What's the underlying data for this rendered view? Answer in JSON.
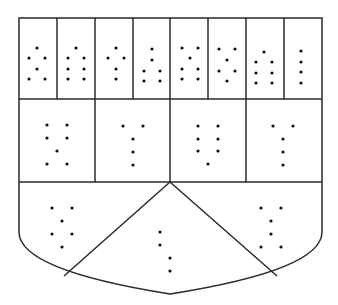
{
  "diagram": {
    "type": "heraldic-shield-braille-cells",
    "colors": {
      "line": "#2a2a2a",
      "dot": "#111111",
      "background": "#ffffff"
    },
    "shield": {
      "left": 19,
      "top": 18,
      "right": 322,
      "row1_bottom": 99,
      "row2_bottom": 182,
      "side_bottom": 232,
      "apex_x": 170,
      "apex_y": 294
    },
    "row1_dividers": [
      57,
      95,
      133,
      170,
      208,
      246,
      284
    ],
    "row2_dividers": [
      95,
      170,
      246
    ],
    "chevron": {
      "top": [
        170,
        182
      ],
      "left_foot": [
        64,
        276
      ],
      "right_foot": [
        277,
        276
      ]
    },
    "row1_cells": [
      {
        "dots": [
          [
            37,
            48
          ],
          [
            29,
            58
          ],
          [
            45,
            58
          ],
          [
            37,
            69
          ],
          [
            29,
            79
          ],
          [
            45,
            79
          ]
        ]
      },
      {
        "dots": [
          [
            76,
            48
          ],
          [
            68,
            58
          ],
          [
            84,
            58
          ],
          [
            68,
            69
          ],
          [
            84,
            69
          ],
          [
            68,
            79
          ],
          [
            84,
            79
          ]
        ]
      },
      {
        "dots": [
          [
            116,
            48
          ],
          [
            108,
            58
          ],
          [
            124,
            58
          ],
          [
            116,
            69
          ],
          [
            116,
            79
          ]
        ]
      },
      {
        "dots": [
          [
            152,
            49
          ],
          [
            152,
            60
          ],
          [
            144,
            71
          ],
          [
            160,
            71
          ],
          [
            144,
            81
          ],
          [
            160,
            81
          ]
        ]
      },
      {
        "dots": [
          [
            182,
            48
          ],
          [
            198,
            48
          ],
          [
            190,
            58
          ],
          [
            182,
            69
          ],
          [
            198,
            69
          ],
          [
            182,
            79
          ],
          [
            198,
            79
          ]
        ]
      },
      {
        "dots": [
          [
            219,
            49
          ],
          [
            235,
            49
          ],
          [
            227,
            60
          ],
          [
            219,
            71
          ],
          [
            235,
            71
          ],
          [
            227,
            81
          ]
        ]
      },
      {
        "dots": [
          [
            264,
            52
          ],
          [
            256,
            62
          ],
          [
            272,
            62
          ],
          [
            256,
            73
          ],
          [
            272,
            73
          ],
          [
            256,
            83
          ],
          [
            272,
            83
          ]
        ]
      },
      {
        "dots": [
          [
            301,
            51
          ],
          [
            301,
            62
          ],
          [
            301,
            72
          ],
          [
            301,
            83
          ]
        ]
      }
    ],
    "row2_cells": [
      {
        "dots": [
          [
            47,
            125
          ],
          [
            67,
            125
          ],
          [
            47,
            138
          ],
          [
            67,
            138
          ],
          [
            57,
            151
          ],
          [
            47,
            164
          ],
          [
            67,
            164
          ]
        ]
      },
      {
        "dots": [
          [
            123,
            126
          ],
          [
            143,
            126
          ],
          [
            133,
            139
          ],
          [
            133,
            152
          ],
          [
            133,
            165
          ]
        ]
      },
      {
        "dots": [
          [
            198,
            126
          ],
          [
            218,
            126
          ],
          [
            198,
            139
          ],
          [
            218,
            139
          ],
          [
            198,
            151
          ],
          [
            218,
            151
          ],
          [
            208,
            164
          ]
        ]
      },
      {
        "dots": [
          [
            273,
            126
          ],
          [
            293,
            126
          ],
          [
            283,
            139
          ],
          [
            283,
            152
          ],
          [
            283,
            165
          ]
        ]
      }
    ],
    "row3_cells": [
      {
        "dots": [
          [
            52,
            208
          ],
          [
            72,
            208
          ],
          [
            62,
            221
          ],
          [
            52,
            234
          ],
          [
            72,
            234
          ],
          [
            62,
            247
          ]
        ]
      },
      {
        "dots": [
          [
            160,
            232
          ],
          [
            160,
            245
          ],
          [
            170,
            258
          ],
          [
            170,
            271
          ]
        ]
      },
      {
        "dots": [
          [
            261,
            208
          ],
          [
            281,
            208
          ],
          [
            271,
            221
          ],
          [
            271,
            234
          ],
          [
            261,
            247
          ],
          [
            281,
            247
          ]
        ]
      }
    ]
  }
}
